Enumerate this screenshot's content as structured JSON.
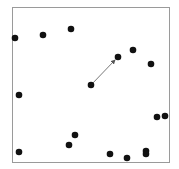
{
  "frame": {
    "x": 12,
    "y": 7,
    "width": 157,
    "height": 155,
    "stroke": "#9a9a9a"
  },
  "dot_color": "#111111",
  "dot_radius": 3.3,
  "dots": [
    {
      "x": 15,
      "y": 38
    },
    {
      "x": 43,
      "y": 35
    },
    {
      "x": 71,
      "y": 29
    },
    {
      "x": 118,
      "y": 57
    },
    {
      "x": 133,
      "y": 50
    },
    {
      "x": 151,
      "y": 64
    },
    {
      "x": 91,
      "y": 85
    },
    {
      "x": 19,
      "y": 95
    },
    {
      "x": 157,
      "y": 117
    },
    {
      "x": 165,
      "y": 116
    },
    {
      "x": 75,
      "y": 135
    },
    {
      "x": 69,
      "y": 145
    },
    {
      "x": 19,
      "y": 152
    },
    {
      "x": 110,
      "y": 154
    },
    {
      "x": 127,
      "y": 158
    },
    {
      "x": 146,
      "y": 151
    },
    {
      "x": 146,
      "y": 154
    }
  ],
  "arrow": {
    "x1": 91,
    "y1": 85,
    "x2": 115,
    "y2": 60,
    "color": "#555555"
  }
}
